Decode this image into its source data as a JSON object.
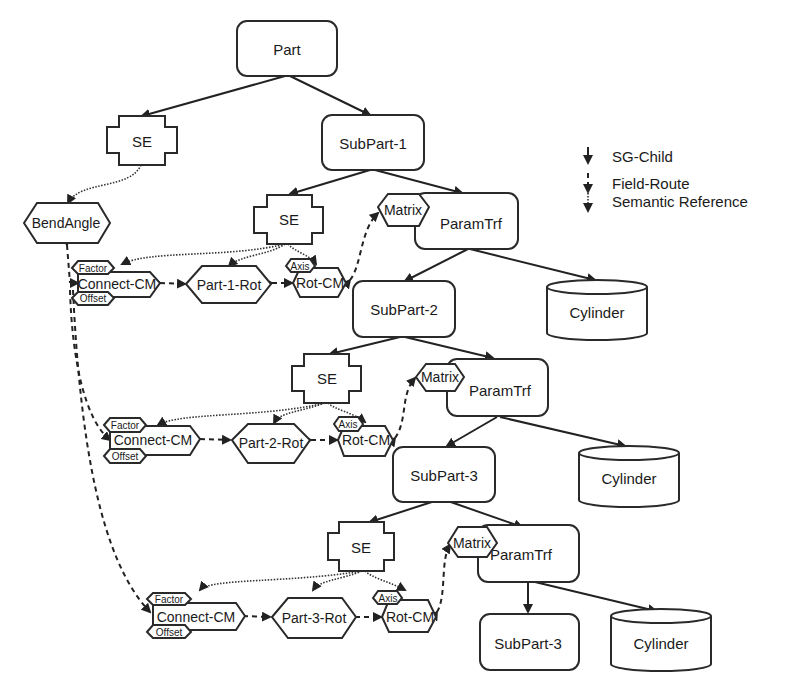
{
  "legend": {
    "items": [
      {
        "label": "SG-Child",
        "style": "solid"
      },
      {
        "label": "Field-Route",
        "style": "dashed"
      },
      {
        "label": "Semantic Reference",
        "style": "dotted"
      }
    ]
  },
  "nodes": {
    "part": "Part",
    "se_top": "SE",
    "subpart1": "SubPart-1",
    "bendangle": "BendAngle",
    "level1": {
      "se": "SE",
      "matrix": "Matrix",
      "paramtrf": "ParamTrf",
      "factor": "Factor",
      "connect": "Connect-CM",
      "offset": "Offset",
      "rot": "Part-1-Rot",
      "axis": "Axis",
      "rotcm": "Rot-CM",
      "subpart": "SubPart-2",
      "cylinder": "Cylinder"
    },
    "level2": {
      "se": "SE",
      "matrix": "Matrix",
      "paramtrf": "ParamTrf",
      "factor": "Factor",
      "connect": "Connect-CM",
      "offset": "Offset",
      "rot": "Part-2-Rot",
      "axis": "Axis",
      "rotcm": "Rot-CM",
      "subpart": "SubPart-3",
      "cylinder": "Cylinder"
    },
    "level3": {
      "se": "SE",
      "matrix": "Matrix",
      "paramtrf": "ParamTrf",
      "factor": "Factor",
      "connect": "Connect-CM",
      "offset": "Offset",
      "rot": "Part-3-Rot",
      "axis": "Axis",
      "rotcm": "Rot-CM",
      "subpart": "SubPart-3",
      "cylinder": "Cylinder"
    }
  }
}
